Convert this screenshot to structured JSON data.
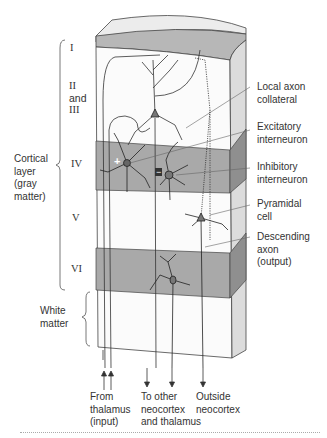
{
  "diagram": {
    "layers": [
      {
        "id": "I",
        "label": "I"
      },
      {
        "id": "II-III",
        "label_lines": [
          "II",
          "and",
          "III"
        ]
      },
      {
        "id": "IV",
        "label": "IV"
      },
      {
        "id": "V",
        "label": "V"
      },
      {
        "id": "VI",
        "label": "VI"
      }
    ],
    "brackets": {
      "cortical": {
        "lines": [
          "Cortical",
          "layer",
          "(gray",
          "matter)"
        ]
      },
      "white": {
        "lines": [
          "White",
          "matter"
        ]
      }
    },
    "right_labels": [
      {
        "id": "local-axon-collateral",
        "lines": [
          "Local axon",
          "collateral"
        ]
      },
      {
        "id": "excitatory-interneuron",
        "lines": [
          "Excitatory",
          "interneuron"
        ]
      },
      {
        "id": "inhibitory-interneuron",
        "lines": [
          "Inhibitory",
          "interneuron"
        ]
      },
      {
        "id": "pyramidal-cell",
        "lines": [
          "Pyramidal",
          "cell"
        ]
      },
      {
        "id": "descending-axon",
        "lines": [
          "Descending",
          "axon",
          "(output)"
        ]
      }
    ],
    "bottom_labels": [
      {
        "id": "from-thalamus",
        "lines": [
          "From",
          "thalamus",
          "(input)"
        ],
        "direction": "up"
      },
      {
        "id": "to-other-neocortex",
        "lines": [
          "To other",
          "neocortex",
          "and thalamus"
        ],
        "direction": "down"
      },
      {
        "id": "outside-neocortex",
        "lines": [
          "Outside",
          "neocortex"
        ],
        "direction": "down"
      }
    ],
    "markers": {
      "excitatory": "+",
      "inhibitory": "−"
    },
    "colors": {
      "shaded_layer": "#a9a9a9",
      "shaded_side": "#8e8e8e",
      "top_band": "#b5b5b5",
      "top_face": "#e6e6e6",
      "side_face": "#d6d6d6",
      "line": "#333333"
    }
  }
}
